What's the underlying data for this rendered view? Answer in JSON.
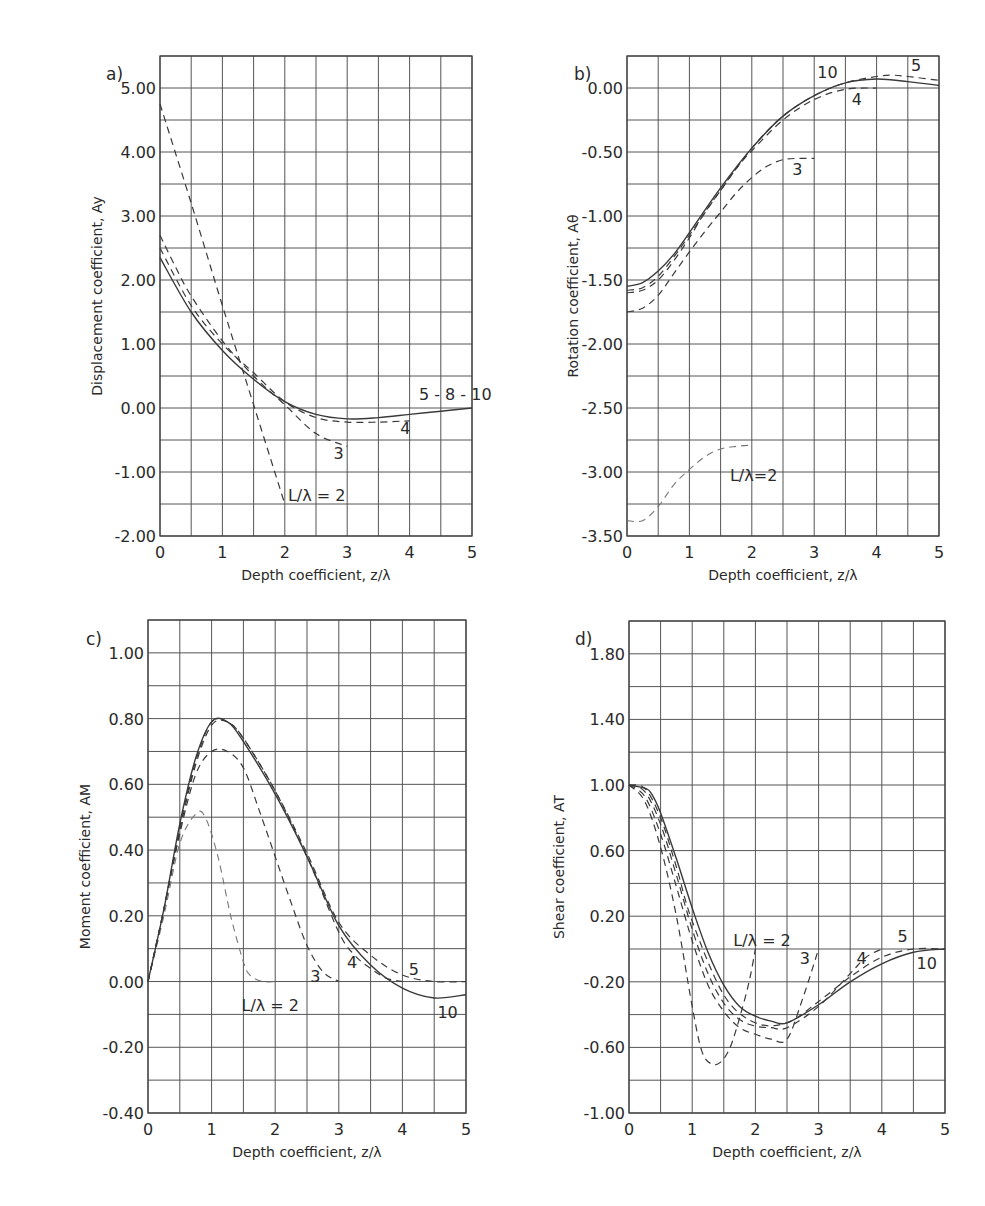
{
  "figure": {
    "panels": [
      {
        "id": "a",
        "label": "a)",
        "ylabel": "Displacement coefficient, Ay",
        "xlabel": "Depth coefficient, z/λ"
      },
      {
        "id": "b",
        "label": "b)",
        "ylabel": "Rotation coefficient, Aθ",
        "xlabel": "Depth coefficient, z/λ"
      },
      {
        "id": "c",
        "label": "c)",
        "ylabel": "Moment coefficient, AM",
        "xlabel": "Depth coefficient, z/λ"
      },
      {
        "id": "d",
        "label": "d)",
        "ylabel": "Shear coefficient, AT",
        "xlabel": "Depth coefficient, z/λ"
      }
    ]
  },
  "chart_data": [
    {
      "panel": "a",
      "type": "line",
      "title": "",
      "xlabel": "Depth coefficient, z/λ",
      "ylabel": "Displacement coefficient, Ay",
      "xlim": [
        0,
        5
      ],
      "ylim": [
        -2.0,
        5.5
      ],
      "x_ticks": [
        "0",
        "1",
        "2",
        "3",
        "4",
        "5"
      ],
      "y_ticks": [
        "5.00",
        "4.00",
        "3.00",
        "2.00",
        "1.00",
        "0.00",
        "-1.00",
        "-2.00"
      ],
      "y_tick_values": [
        5,
        4,
        3,
        2,
        1,
        0,
        -1,
        -2
      ],
      "grid": true,
      "grid_x_step": 0.5,
      "grid_y_step": 0.5,
      "series": [
        {
          "name": "L/λ = 2",
          "style": "dash",
          "x": [
            0,
            0.5,
            1.0,
            1.5,
            2.0
          ],
          "y": [
            4.75,
            3.2,
            1.6,
            0.05,
            -1.5
          ]
        },
        {
          "name": "3",
          "style": "dash",
          "x": [
            0,
            0.25,
            0.5,
            1.0,
            1.5,
            2.0,
            2.5,
            3.0
          ],
          "y": [
            2.7,
            2.2,
            1.75,
            1.05,
            0.5,
            0.05,
            -0.4,
            -0.6
          ]
        },
        {
          "name": "4",
          "style": "dash",
          "x": [
            0,
            0.5,
            1.0,
            1.5,
            2.0,
            2.5,
            3.0,
            3.5,
            4.0
          ],
          "y": [
            2.5,
            1.6,
            1.0,
            0.55,
            0.1,
            -0.15,
            -0.22,
            -0.22,
            -0.2
          ]
        },
        {
          "name": "5 - 8 - 10",
          "style": "solid",
          "x": [
            0,
            0.5,
            1.0,
            1.5,
            2.0,
            2.5,
            3.0,
            3.5,
            4.0,
            4.5,
            5.0
          ],
          "y": [
            2.35,
            1.5,
            0.9,
            0.45,
            0.1,
            -0.1,
            -0.17,
            -0.15,
            -0.1,
            -0.05,
            0.0
          ]
        }
      ],
      "annotations": [
        {
          "text": "5 - 8 - 10",
          "x": 4.15,
          "y": 0.12
        },
        {
          "text": "4",
          "x": 3.85,
          "y": -0.4
        },
        {
          "text": "3",
          "x": 2.78,
          "y": -0.8
        },
        {
          "text": "L/λ = 2",
          "x": 2.05,
          "y": -1.45
        }
      ]
    },
    {
      "panel": "b",
      "type": "line",
      "title": "",
      "xlabel": "Depth coefficient, z/λ",
      "ylabel": "Rotation coefficient, Aθ",
      "xlim": [
        0,
        5
      ],
      "ylim": [
        -3.5,
        0.25
      ],
      "x_ticks": [
        "0",
        "1",
        "2",
        "3",
        "4",
        "5"
      ],
      "y_ticks": [
        "0.00",
        "-0.50",
        "-1.00",
        "-1.50",
        "-2.00",
        "-2.50",
        "-3.00",
        "-3.50"
      ],
      "y_tick_values": [
        0,
        -0.5,
        -1.0,
        -1.5,
        -2.0,
        -2.5,
        -3.0,
        -3.5
      ],
      "grid": true,
      "grid_x_step": 0.5,
      "grid_y_step": 0.25,
      "series": [
        {
          "name": "L/λ=2",
          "style": "dash-light",
          "x": [
            0,
            0.25,
            0.5,
            0.75,
            1.0,
            1.25,
            1.5,
            1.75,
            2.0
          ],
          "y": [
            -3.38,
            -3.38,
            -3.27,
            -3.1,
            -2.98,
            -2.88,
            -2.82,
            -2.8,
            -2.79
          ]
        },
        {
          "name": "3",
          "style": "dash",
          "x": [
            0,
            0.25,
            0.5,
            0.75,
            1.0,
            1.25,
            1.5,
            1.75,
            2.0,
            2.25,
            2.5,
            2.75,
            3.0
          ],
          "y": [
            -1.75,
            -1.72,
            -1.62,
            -1.45,
            -1.28,
            -1.12,
            -0.97,
            -0.82,
            -0.7,
            -0.61,
            -0.56,
            -0.55,
            -0.55
          ]
        },
        {
          "name": "4",
          "style": "dash",
          "x": [
            0,
            0.25,
            0.5,
            0.75,
            1.0,
            1.25,
            1.5,
            1.75,
            2.0,
            2.5,
            3.0,
            3.5,
            4.0
          ],
          "y": [
            -1.6,
            -1.58,
            -1.5,
            -1.35,
            -1.17,
            -0.97,
            -0.8,
            -0.63,
            -0.49,
            -0.25,
            -0.09,
            -0.01,
            0.0
          ]
        },
        {
          "name": "5",
          "style": "dash",
          "x": [
            0,
            0.25,
            0.5,
            0.75,
            1.0,
            1.5,
            2.0,
            2.5,
            3.0,
            3.5,
            4.0,
            4.25,
            4.5,
            5.0
          ],
          "y": [
            -1.58,
            -1.56,
            -1.47,
            -1.32,
            -1.15,
            -0.8,
            -0.47,
            -0.22,
            -0.06,
            0.04,
            0.09,
            0.1,
            0.09,
            0.06
          ]
        },
        {
          "name": "10",
          "style": "solid",
          "x": [
            0,
            0.25,
            0.5,
            0.75,
            1.0,
            1.5,
            2.0,
            2.5,
            3.0,
            3.5,
            4.0,
            4.5,
            5.0
          ],
          "y": [
            -1.55,
            -1.52,
            -1.43,
            -1.3,
            -1.13,
            -0.78,
            -0.47,
            -0.22,
            -0.06,
            0.04,
            0.07,
            0.05,
            0.02
          ]
        }
      ],
      "annotations": [
        {
          "text": "10",
          "x": 3.05,
          "y": 0.08
        },
        {
          "text": "5",
          "x": 4.55,
          "y": 0.13
        },
        {
          "text": "4",
          "x": 3.6,
          "y": -0.13
        },
        {
          "text": "3",
          "x": 2.65,
          "y": -0.68
        },
        {
          "text": "L/λ=2",
          "x": 1.65,
          "y": -3.07
        }
      ]
    },
    {
      "panel": "c",
      "type": "line",
      "title": "",
      "xlabel": "Depth coefficient, z/λ",
      "ylabel": "Moment coefficient, AM",
      "xlim": [
        0,
        5
      ],
      "ylim": [
        -0.4,
        1.1
      ],
      "x_ticks": [
        "0",
        "1",
        "2",
        "3",
        "4",
        "5"
      ],
      "y_ticks": [
        "1.00",
        "0.80",
        "0.60",
        "0.40",
        "0.20",
        "0.00",
        "-0.20",
        "-0.40"
      ],
      "y_tick_values": [
        1.0,
        0.8,
        0.6,
        0.4,
        0.2,
        0.0,
        -0.2,
        -0.4
      ],
      "grid": true,
      "grid_x_step": 0.5,
      "grid_y_step": 0.1,
      "series": [
        {
          "name": "L/λ = 2",
          "style": "dash-light",
          "x": [
            0,
            0.25,
            0.5,
            0.75,
            0.9,
            1.1,
            1.3,
            1.5,
            1.6,
            1.8,
            2.0
          ],
          "y": [
            0,
            0.2,
            0.42,
            0.51,
            0.5,
            0.38,
            0.2,
            0.06,
            0.02,
            0.0,
            0.0
          ]
        },
        {
          "name": "3",
          "style": "dash",
          "x": [
            0,
            0.25,
            0.5,
            0.75,
            1.0,
            1.25,
            1.5,
            1.75,
            2.0,
            2.25,
            2.5,
            2.75,
            3.0
          ],
          "y": [
            0,
            0.22,
            0.45,
            0.63,
            0.7,
            0.7,
            0.65,
            0.52,
            0.38,
            0.24,
            0.11,
            0.03,
            0.0
          ]
        },
        {
          "name": "4",
          "style": "dash",
          "x": [
            0,
            0.25,
            0.5,
            0.75,
            1.0,
            1.25,
            1.5,
            2.0,
            2.5,
            3.0,
            3.25,
            3.5,
            3.75,
            4.0
          ],
          "y": [
            0,
            0.22,
            0.46,
            0.66,
            0.78,
            0.79,
            0.74,
            0.58,
            0.38,
            0.15,
            0.08,
            0.04,
            0.01,
            0.0
          ]
        },
        {
          "name": "5",
          "style": "dash",
          "x": [
            0,
            0.25,
            0.5,
            0.75,
            1.0,
            1.25,
            1.5,
            2.0,
            2.5,
            3.0,
            3.5,
            4.0,
            4.5,
            5.0
          ],
          "y": [
            0,
            0.22,
            0.47,
            0.67,
            0.79,
            0.79,
            0.74,
            0.58,
            0.39,
            0.18,
            0.08,
            0.02,
            0.0,
            0.0
          ]
        },
        {
          "name": "10",
          "style": "solid",
          "x": [
            0,
            0.25,
            0.5,
            0.75,
            1.0,
            1.25,
            1.5,
            2.0,
            2.5,
            3.0,
            3.5,
            4.0,
            4.5,
            5.0
          ],
          "y": [
            0,
            0.22,
            0.48,
            0.68,
            0.79,
            0.79,
            0.73,
            0.57,
            0.38,
            0.17,
            0.05,
            -0.02,
            -0.05,
            -0.04
          ]
        }
      ],
      "annotations": [
        {
          "text": "L/λ = 2",
          "x": 1.47,
          "y": -0.09
        },
        {
          "text": "3",
          "x": 2.55,
          "y": 0.0
        },
        {
          "text": "4",
          "x": 3.13,
          "y": 0.04
        },
        {
          "text": "5",
          "x": 4.1,
          "y": 0.02
        },
        {
          "text": "10",
          "x": 4.55,
          "y": -0.11
        }
      ]
    },
    {
      "panel": "d",
      "type": "line",
      "title": "",
      "xlabel": "Depth coefficient, z/λ",
      "ylabel": "Shear coefficient, AT",
      "xlim": [
        0,
        5
      ],
      "ylim": [
        -1.0,
        2.0
      ],
      "x_ticks": [
        "0",
        "1",
        "2",
        "3",
        "4",
        "5"
      ],
      "y_ticks": [
        "1.80",
        "1.40",
        "1.00",
        "0.60",
        "0.20",
        "-0.20",
        "-0.60",
        "-1.00"
      ],
      "y_tick_values": [
        1.8,
        1.4,
        1.0,
        0.6,
        0.2,
        -0.2,
        -0.6,
        -1.0
      ],
      "grid": true,
      "grid_x_step": 0.5,
      "grid_y_step": 0.2,
      "series": [
        {
          "name": "L/λ = 2",
          "style": "dash",
          "x": [
            0,
            0.25,
            0.5,
            0.75,
            1.0,
            1.15,
            1.3,
            1.45,
            1.6,
            1.75,
            1.9,
            2.0
          ],
          "y": [
            1.0,
            0.9,
            0.62,
            0.2,
            -0.35,
            -0.62,
            -0.7,
            -0.69,
            -0.6,
            -0.42,
            -0.2,
            0.0
          ]
        },
        {
          "name": "3",
          "style": "dash",
          "x": [
            0,
            0.25,
            0.5,
            0.75,
            1.0,
            1.25,
            1.5,
            1.75,
            2.0,
            2.25,
            2.5,
            2.75,
            3.0
          ],
          "y": [
            1.0,
            0.93,
            0.7,
            0.38,
            0.05,
            -0.22,
            -0.38,
            -0.48,
            -0.52,
            -0.55,
            -0.55,
            -0.3,
            0.0
          ]
        },
        {
          "name": "4",
          "style": "dash",
          "x": [
            0,
            0.25,
            0.5,
            0.75,
            1.0,
            1.25,
            1.5,
            1.75,
            2.0,
            2.25,
            2.5,
            3.0,
            3.5,
            3.75,
            4.0
          ],
          "y": [
            1.0,
            0.96,
            0.76,
            0.45,
            0.12,
            -0.15,
            -0.33,
            -0.43,
            -0.47,
            -0.48,
            -0.48,
            -0.35,
            -0.15,
            -0.05,
            0.0
          ]
        },
        {
          "name": "5",
          "style": "dash",
          "x": [
            0,
            0.25,
            0.5,
            0.75,
            1.0,
            1.5,
            2.0,
            2.5,
            3.0,
            3.5,
            4.0,
            4.5,
            5.0
          ],
          "y": [
            1.0,
            0.98,
            0.8,
            0.5,
            0.17,
            -0.28,
            -0.45,
            -0.45,
            -0.32,
            -0.17,
            -0.05,
            0.0,
            0.0
          ]
        },
        {
          "name": "10",
          "style": "solid",
          "x": [
            0,
            0.25,
            0.35,
            0.5,
            0.75,
            1.0,
            1.25,
            1.5,
            1.75,
            2.0,
            2.25,
            2.5,
            3.0,
            3.5,
            4.0,
            4.5,
            5.0
          ],
          "y": [
            1.0,
            0.98,
            0.95,
            0.83,
            0.55,
            0.25,
            -0.02,
            -0.22,
            -0.35,
            -0.41,
            -0.44,
            -0.45,
            -0.34,
            -0.2,
            -0.09,
            -0.02,
            0.0
          ]
        }
      ],
      "annotations": [
        {
          "text": "L/λ = 2",
          "x": 1.65,
          "y": 0.02
        },
        {
          "text": "3",
          "x": 2.7,
          "y": -0.09
        },
        {
          "text": "4",
          "x": 3.6,
          "y": -0.09
        },
        {
          "text": "5",
          "x": 4.25,
          "y": 0.04
        },
        {
          "text": "10",
          "x": 4.55,
          "y": -0.12
        }
      ]
    }
  ]
}
